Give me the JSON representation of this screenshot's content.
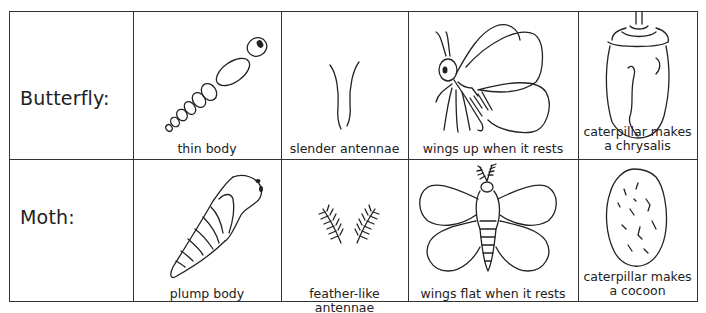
{
  "table": {
    "rows": [
      {
        "label": "Butterfly:",
        "cells": [
          {
            "icon": "thin-body-icon",
            "caption": "thin body"
          },
          {
            "icon": "slender-antennae-icon",
            "caption": "slender antennae"
          },
          {
            "icon": "butterfly-wings-up-icon",
            "caption": "wings up when it rests"
          },
          {
            "icon": "chrysalis-icon",
            "caption_line1": "caterpillar makes",
            "caption_line2": "a chrysalis"
          }
        ]
      },
      {
        "label": "Moth:",
        "cells": [
          {
            "icon": "plump-body-icon",
            "caption": "plump body"
          },
          {
            "icon": "feather-antennae-icon",
            "caption": "feather-like antennae"
          },
          {
            "icon": "moth-wings-flat-icon",
            "caption": "wings flat when it rests"
          },
          {
            "icon": "cocoon-icon",
            "caption_line1": "caterpillar makes",
            "caption_line2": "a cocoon"
          }
        ]
      }
    ]
  }
}
